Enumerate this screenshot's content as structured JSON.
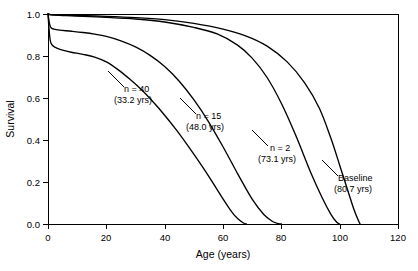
{
  "chart_data": {
    "type": "line",
    "title": "",
    "xlabel": "Age (years)",
    "ylabel": "Survival",
    "xlim": [
      0,
      120
    ],
    "ylim": [
      0.0,
      1.0
    ],
    "xticks": [
      0,
      20,
      40,
      60,
      80,
      100,
      120
    ],
    "xticklabels": [
      "0",
      "20",
      "40",
      "60",
      "80",
      "100",
      "120"
    ],
    "yticks": [
      0.0,
      0.2,
      0.4,
      0.6,
      0.8,
      1.0
    ],
    "yticklabels": [
      "0.0",
      "0.2",
      "0.4",
      "0.6",
      "0.8",
      "1.0"
    ],
    "grid": false,
    "legend_position": "inline-annotations",
    "series": [
      {
        "name": "n = 40",
        "label_line1": "n = 40",
        "label_line2": "(33.2 yrs)",
        "median_life_expectancy_yrs": 33.2,
        "x": [
          0,
          0.5,
          1,
          2,
          3,
          5,
          8,
          12,
          16,
          20,
          24,
          28,
          32,
          36,
          40,
          44,
          48,
          52,
          56,
          60,
          63,
          65,
          67,
          68
        ],
        "y": [
          1.0,
          0.905,
          0.862,
          0.845,
          0.838,
          0.828,
          0.818,
          0.808,
          0.795,
          0.772,
          0.735,
          0.69,
          0.64,
          0.582,
          0.518,
          0.448,
          0.372,
          0.292,
          0.208,
          0.12,
          0.058,
          0.026,
          0.005,
          0.0
        ]
      },
      {
        "name": "n = 15",
        "label_line1": "n = 15",
        "label_line2": "(48.0 yrs)",
        "median_life_expectancy_yrs": 48.0,
        "x": [
          0,
          0.5,
          1,
          2,
          4,
          8,
          12,
          16,
          20,
          25,
          30,
          35,
          40,
          45,
          50,
          55,
          60,
          65,
          70,
          74,
          77,
          79,
          80
        ],
        "y": [
          1.0,
          0.955,
          0.935,
          0.928,
          0.923,
          0.918,
          0.912,
          0.904,
          0.893,
          0.872,
          0.843,
          0.803,
          0.75,
          0.68,
          0.592,
          0.488,
          0.368,
          0.24,
          0.118,
          0.045,
          0.012,
          0.002,
          0.0
        ]
      },
      {
        "name": "n = 2",
        "label_line1": "n = 2",
        "label_line2": "(73.1 yrs)",
        "median_life_expectancy_yrs": 73.1,
        "x": [
          0,
          1,
          5,
          10,
          20,
          30,
          40,
          50,
          58,
          65,
          70,
          75,
          80,
          85,
          90,
          94,
          97,
          99,
          100
        ],
        "y": [
          1.0,
          0.996,
          0.993,
          0.99,
          0.984,
          0.976,
          0.962,
          0.936,
          0.905,
          0.852,
          0.79,
          0.7,
          0.575,
          0.42,
          0.248,
          0.125,
          0.046,
          0.008,
          0.0
        ]
      },
      {
        "name": "Baseline",
        "label_line1": "Baseline",
        "label_line2": "(80.7 yrs)",
        "median_life_expectancy_yrs": 80.7,
        "x": [
          0,
          1,
          5,
          10,
          20,
          30,
          40,
          50,
          60,
          68,
          75,
          82,
          88,
          93,
          97,
          100,
          103,
          105,
          106.5,
          107
        ],
        "y": [
          1.0,
          0.997,
          0.995,
          0.993,
          0.989,
          0.983,
          0.973,
          0.955,
          0.928,
          0.895,
          0.848,
          0.772,
          0.672,
          0.552,
          0.408,
          0.28,
          0.15,
          0.065,
          0.014,
          0.0
        ]
      }
    ],
    "annotations": [
      {
        "id": "annot-n40",
        "line1": "n = 40",
        "line2": "(33.2 yrs)"
      },
      {
        "id": "annot-n15",
        "line1": "n = 15",
        "line2": "(48.0 yrs)"
      },
      {
        "id": "annot-n2",
        "line1": "n = 2",
        "line2": "(73.1 yrs)"
      },
      {
        "id": "annot-baseline",
        "line1": "Baseline",
        "line2": "(80.7 yrs)"
      }
    ],
    "colors": {
      "curve": "#000000",
      "axis": "#000000",
      "background": "#ffffff"
    }
  }
}
